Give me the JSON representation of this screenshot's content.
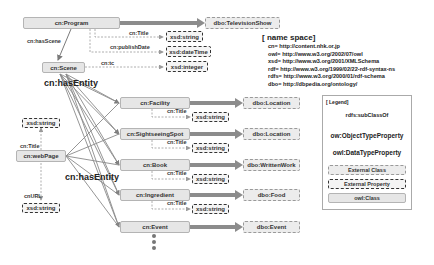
{
  "diagram": {
    "nodes": {
      "program": "cn:Program",
      "television_show": "dbo:TelevisionShow",
      "scene": "cn:Scene",
      "webpage": "cn:webPage",
      "facility": "cn:Facility",
      "sightseeing_spot": "cn:SightseeingSpot",
      "book": "cn:Book",
      "ingredient": "cn:Ingredient",
      "event": "cn:Event",
      "location_1": "dbo:Location",
      "location_2": "dbo:Location",
      "written_work": "dbo:WrittenWork",
      "food": "dbo:Food",
      "dbo_event": "dbo:Event",
      "program_title_type": "xsd:string",
      "publish_date_type": "xsd:dateTime",
      "tc_type": "xsd:integer",
      "facility_title_type": "xsd:string",
      "spot_title_type": "xsd:string",
      "book_title_type": "xsd:string",
      "ingredient_title_type": "xsd:string",
      "webpage_title_type": "xsd:string",
      "webpage_url_type": "xsd:string"
    },
    "edges": {
      "has_scene": "cn:hasScene",
      "program_title": "cn:Title",
      "publish_date": "cn:publishDate",
      "tc": "cn:tc",
      "has_entity_1": "cn:hasEntity",
      "has_entity_2": "cn:hasEntity",
      "facility_title": "cn:Title",
      "spot_title": "cn:Title",
      "book_title": "cn:Title",
      "ingredient_title": "cn:Title",
      "webpage_title": "cn:Title",
      "webpage_url": "cnURL"
    }
  },
  "namespace": {
    "title": "[ name space]",
    "lines": [
      "cn= http://content.nhk.or.jp",
      "owl= http://www.w3.org/2002/07/owl",
      "xsd= http://www.w3.org/2001/XMLSchema",
      "rdf= http://www.w3.org/1999/02/22-rdf-syntax-ns",
      "rdfs= http://www.w3.org/2000/01/rdf-schema",
      "dbo= http://dbpedia.org/ontology/"
    ]
  },
  "legend": {
    "title": "[ Legend]",
    "subclass": "rdfs:subClassOf",
    "object_property": "ow:ObjectTypeProperty",
    "data_property": "owl:DataTypeProperty",
    "external_class": "External Class",
    "external_property": "External Property",
    "owl_class": "owl:Class"
  },
  "colors": {
    "class_fill": "#e6e6e6",
    "thick_arrow": "#8c8c8c",
    "line": "#7a7a7a"
  }
}
